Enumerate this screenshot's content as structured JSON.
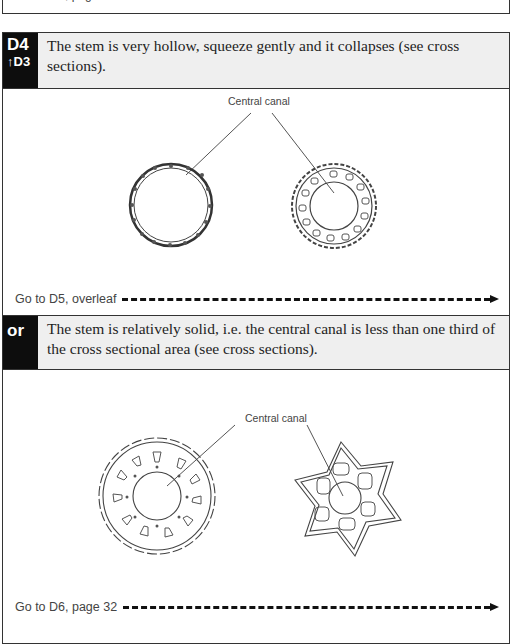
{
  "previous_section": {
    "goto_text": "Go to D7, page 33"
  },
  "couplet": {
    "key": "D4",
    "back_reference": "↑D3",
    "lead_text": "The stem is very hollow, squeeze gently and it collapses (see cross sections).",
    "figure": {
      "label": "Central canal",
      "items": [
        "hollow-stem-cross-section-thin-wall",
        "hollow-stem-cross-section-ridged"
      ]
    },
    "goto_text": "Go to D5, overleaf"
  },
  "alternative": {
    "key": "or",
    "lead_text": "The stem is relatively solid, i.e. the central canal is less than one third of the cross sectional area (see cross sections).",
    "figure": {
      "label": "Central canal",
      "items": [
        "solid-stem-cross-section-scalloped",
        "solid-stem-cross-section-star"
      ]
    },
    "goto_text": "Go to D6, page 32"
  },
  "colors": {
    "label_bg": "#0d0d0d",
    "header_bg": "#efefef",
    "border": "#333333",
    "arrow": "#111111"
  }
}
